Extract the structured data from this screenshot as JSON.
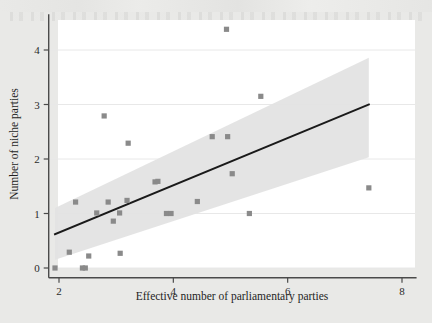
{
  "figure": {
    "background_color": "#e9e9e7",
    "plot_background_color": "#ffffff",
    "marker_color": "#8a8a8a",
    "line_color": "#1a1a1a",
    "band_color": "#e3e3e3",
    "grid_color": "#e8e8e8",
    "axis_color": "#4a4a4a"
  },
  "chart_data": {
    "type": "scatter",
    "title": "",
    "subtitle": "",
    "xlabel": "Effective number of parliamentary parties",
    "ylabel": "Number of niche parties",
    "xlim": [
      1.82,
      8.15
    ],
    "ylim": [
      -0.18,
      4.62
    ],
    "xticks": [
      2,
      4,
      6,
      8
    ],
    "xtick_labels": [
      "2",
      "4",
      "6",
      "8"
    ],
    "yticks": [
      0,
      1,
      2,
      3,
      4
    ],
    "ytick_labels": [
      "0",
      "1",
      "2",
      "3",
      "4"
    ],
    "grid": "horizontal",
    "legend": "none",
    "series": [
      {
        "name": "observations",
        "marker": "square",
        "color": "#8a8a8a",
        "points": [
          {
            "x": 1.93,
            "y": 0.0
          },
          {
            "x": 2.18,
            "y": 0.29
          },
          {
            "x": 2.29,
            "y": 1.21
          },
          {
            "x": 2.41,
            "y": 0.0
          },
          {
            "x": 2.46,
            "y": 0.0
          },
          {
            "x": 2.52,
            "y": 0.22
          },
          {
            "x": 2.66,
            "y": 1.01
          },
          {
            "x": 2.79,
            "y": 2.79
          },
          {
            "x": 2.86,
            "y": 1.21
          },
          {
            "x": 2.95,
            "y": 0.86
          },
          {
            "x": 3.06,
            "y": 1.01
          },
          {
            "x": 3.07,
            "y": 0.27
          },
          {
            "x": 3.19,
            "y": 1.24
          },
          {
            "x": 3.21,
            "y": 2.29
          },
          {
            "x": 3.68,
            "y": 1.58
          },
          {
            "x": 3.73,
            "y": 1.59
          },
          {
            "x": 3.88,
            "y": 1.0
          },
          {
            "x": 3.96,
            "y": 1.0
          },
          {
            "x": 4.42,
            "y": 1.22
          },
          {
            "x": 4.68,
            "y": 2.41
          },
          {
            "x": 4.93,
            "y": 4.38
          },
          {
            "x": 4.95,
            "y": 2.41
          },
          {
            "x": 5.03,
            "y": 1.73
          },
          {
            "x": 5.33,
            "y": 1.0
          },
          {
            "x": 5.53,
            "y": 3.15
          },
          {
            "x": 7.42,
            "y": 1.47
          }
        ]
      }
    ],
    "fit_line": {
      "name": "linear fit",
      "color": "#1a1a1a",
      "x_start": 1.93,
      "y_start": 0.62,
      "x_end": 7.42,
      "y_end": 3.0
    },
    "confidence_band": {
      "name": "confidence interval",
      "color": "#e3e3e3",
      "x_start": 1.93,
      "x_end": 7.42,
      "upper_start": 1.1,
      "upper_end": 3.86,
      "lower_start": 0.15,
      "lower_end": 2.03
    }
  }
}
